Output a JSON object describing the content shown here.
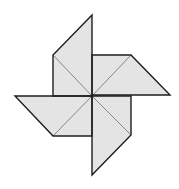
{
  "diagram": {
    "title": "",
    "type": "pinwheel",
    "center": [
      92,
      96
    ],
    "colors": {
      "fill": "#e4e4e4",
      "outline": "#1e1e1e",
      "inner_line": "#7a7a7a",
      "background": "#ffffff"
    },
    "blades": [
      {
        "name": "top",
        "points": [
          [
            92,
            15
          ],
          [
            53,
            55
          ],
          [
            53,
            96
          ],
          [
            92,
            96
          ]
        ]
      },
      {
        "name": "right",
        "points": [
          [
            92,
            55
          ],
          [
            131,
            55
          ],
          [
            170,
            95
          ],
          [
            92,
            95
          ]
        ]
      },
      {
        "name": "bottom",
        "points": [
          [
            92,
            96
          ],
          [
            131,
            96
          ],
          [
            131,
            135
          ],
          [
            92,
            175
          ]
        ]
      },
      {
        "name": "left",
        "points": [
          [
            15,
            96
          ],
          [
            92,
            96
          ],
          [
            92,
            136
          ],
          [
            53,
            136
          ]
        ]
      }
    ],
    "inner_lines": [
      [
        [
          53,
          55
        ],
        [
          92,
          96
        ]
      ],
      [
        [
          131,
          55
        ],
        [
          92,
          96
        ]
      ],
      [
        [
          131,
          135
        ],
        [
          92,
          96
        ]
      ],
      [
        [
          53,
          136
        ],
        [
          92,
          96
        ]
      ]
    ]
  }
}
